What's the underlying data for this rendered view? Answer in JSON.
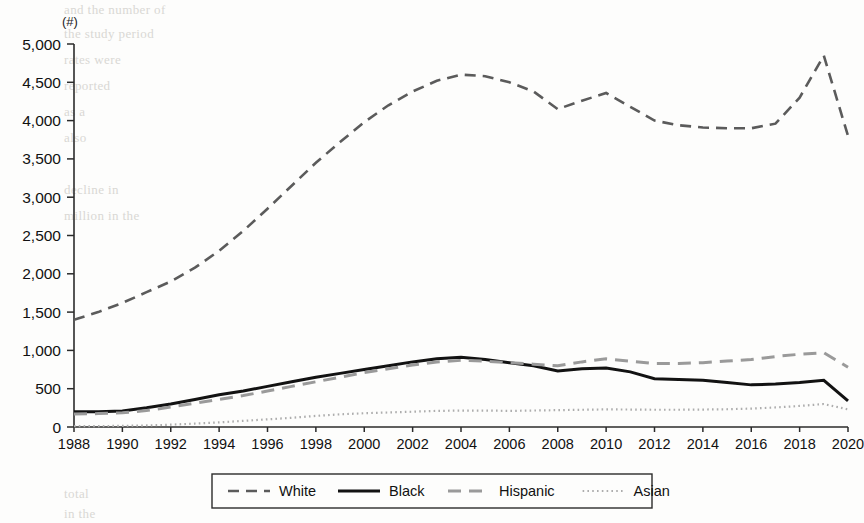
{
  "page": {
    "background_color": "#fdfdfc",
    "axis_color": "#2b2b2b"
  },
  "chart_data": {
    "type": "line",
    "title": "",
    "subtitle": "",
    "xlabel": "",
    "ylabel": "",
    "unit_label": "(#)",
    "grid": false,
    "legend_position": "bottom",
    "xlim": [
      1988,
      2020
    ],
    "ylim": [
      0,
      5000
    ],
    "ytick_step": 500,
    "ytick_labels": [
      "5,000",
      "4,500",
      "4,000",
      "3,500",
      "3,000",
      "2,500",
      "2,000",
      "1,500",
      "1,000",
      "500",
      "0"
    ],
    "ytick_values": [
      5000,
      4500,
      4000,
      3500,
      3000,
      2500,
      2000,
      1500,
      1000,
      500,
      0
    ],
    "xtick_labels": [
      "1988",
      "1990",
      "1992",
      "1994",
      "1996",
      "1998",
      "2000",
      "2002",
      "2004",
      "2006",
      "2008",
      "2010",
      "2012",
      "2014",
      "2016",
      "2018",
      "2020"
    ],
    "xtick_values": [
      1988,
      1990,
      1992,
      1994,
      1996,
      1998,
      2000,
      2002,
      2004,
      2006,
      2008,
      2010,
      2012,
      2014,
      2016,
      2018,
      2020
    ],
    "x": [
      1988,
      1989,
      1990,
      1991,
      1992,
      1993,
      1994,
      1995,
      1996,
      1997,
      1998,
      1999,
      2000,
      2001,
      2002,
      2003,
      2004,
      2005,
      2006,
      2007,
      2008,
      2009,
      2010,
      2011,
      2012,
      2013,
      2014,
      2015,
      2016,
      2017,
      2018,
      2019,
      2020
    ],
    "series": [
      {
        "name": "White",
        "color": "#5b5b5b",
        "style": "dashed",
        "values": [
          1400,
          1500,
          1620,
          1760,
          1900,
          2080,
          2300,
          2560,
          2850,
          3150,
          3450,
          3720,
          3980,
          4200,
          4380,
          4520,
          4600,
          4580,
          4500,
          4380,
          4150,
          4260,
          4360,
          4180,
          4000,
          3940,
          3910,
          3900,
          3900,
          3960,
          4300,
          4850,
          3800
        ]
      },
      {
        "name": "Black",
        "color": "#121212",
        "style": "solid",
        "values": [
          200,
          200,
          210,
          250,
          300,
          360,
          420,
          470,
          530,
          590,
          650,
          700,
          750,
          800,
          850,
          890,
          910,
          880,
          840,
          800,
          730,
          760,
          770,
          720,
          630,
          620,
          610,
          580,
          550,
          560,
          580,
          610,
          340
        ]
      },
      {
        "name": "Hispanic",
        "color": "#9a9a9a",
        "style": "dashed",
        "values": [
          170,
          175,
          185,
          215,
          260,
          310,
          360,
          410,
          470,
          530,
          590,
          650,
          710,
          760,
          810,
          850,
          870,
          860,
          840,
          820,
          800,
          850,
          890,
          860,
          830,
          830,
          840,
          860,
          880,
          920,
          950,
          970,
          780
        ]
      },
      {
        "name": "Asian",
        "color": "#adadad",
        "style": "dotted",
        "values": [
          10,
          12,
          15,
          20,
          30,
          45,
          60,
          80,
          100,
          120,
          145,
          165,
          180,
          190,
          200,
          210,
          215,
          215,
          210,
          215,
          220,
          225,
          230,
          228,
          225,
          225,
          228,
          232,
          240,
          255,
          275,
          300,
          230
        ]
      }
    ]
  },
  "legend": {
    "items": [
      {
        "label": "White",
        "style": "dashed",
        "color": "#5b5b5b"
      },
      {
        "label": "Black",
        "style": "solid",
        "color": "#121212"
      },
      {
        "label": "Hispanic",
        "style": "dashed",
        "color": "#9a9a9a"
      },
      {
        "label": "Asian",
        "style": "dotted",
        "color": "#adadad"
      }
    ]
  },
  "background_text": {
    "lines": [
      "and the number of",
      "the study period",
      "rates were",
      "reported",
      "as a",
      "also",
      "decline in",
      "million in the",
      "total",
      "in the"
    ]
  }
}
